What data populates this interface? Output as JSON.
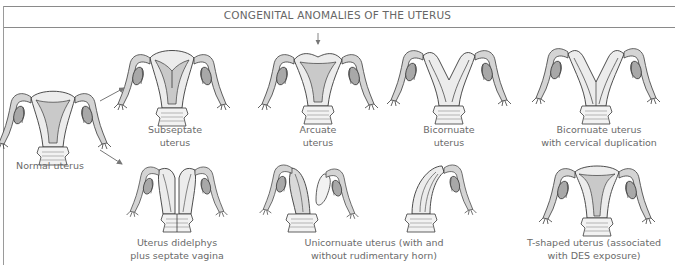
{
  "title": "CONGENITAL ANOMALIES OF THE UTERUS",
  "colors": {
    "outline": "#3a3a3a",
    "body_fill": "#ececec",
    "cavity_fill": "#c9c9c9",
    "ovary_fill": "#a8a8a8",
    "tube_fill": "#d4d4d4",
    "arrow": "#777777",
    "frame": "#8a8a8a",
    "text": "#6a6a6a"
  },
  "figures": [
    {
      "id": "normal",
      "caption": [
        "Normal uterus"
      ]
    },
    {
      "id": "subseptate",
      "caption": [
        "Subseptate",
        "uterus"
      ]
    },
    {
      "id": "arcuate",
      "caption": [
        "Arcuate",
        "uterus"
      ]
    },
    {
      "id": "bicornuate",
      "caption": [
        "Bicornuate",
        "uterus"
      ]
    },
    {
      "id": "bicornuate-cervical",
      "caption": [
        "Bicornuate uterus",
        "with cervical duplication"
      ]
    },
    {
      "id": "didelphys",
      "caption": [
        "Uterus didelphys",
        "plus septate vagina"
      ]
    },
    {
      "id": "unicornuate",
      "caption": [
        "Unicornuate uterus (with and",
        "without rudimentary horn)"
      ]
    },
    {
      "id": "t-shaped",
      "caption": [
        "T-shaped uterus (associated",
        "with DES exposure)"
      ]
    }
  ],
  "annotations": {
    "arrows": [
      "normal-to-subseptate",
      "normal-to-didelphys"
    ],
    "arcuate_indicator": "down-arrow"
  }
}
